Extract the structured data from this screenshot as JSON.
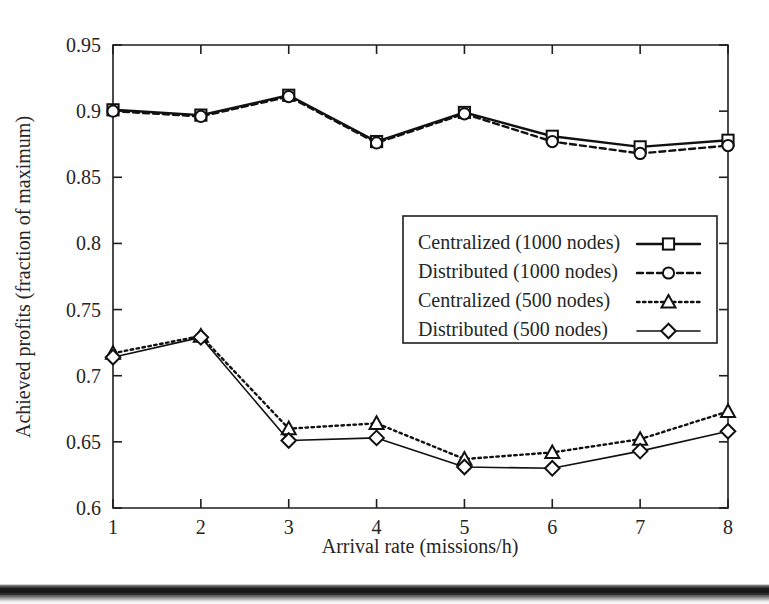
{
  "chart_data": {
    "type": "line",
    "title": "",
    "xlabel": "Arrival rate (missions/h)",
    "ylabel": "Achieved profits (fraction of maximum)",
    "x": [
      1,
      2,
      3,
      4,
      5,
      6,
      7,
      8
    ],
    "xlim": [
      1,
      8
    ],
    "ylim": [
      0.6,
      0.95
    ],
    "xticks": [
      "1",
      "2",
      "3",
      "4",
      "5",
      "6",
      "7",
      "8"
    ],
    "yticks": [
      "0.6",
      "0.65",
      "0.7",
      "0.75",
      "0.8",
      "0.85",
      "0.9",
      "0.95"
    ],
    "grid": false,
    "legend_position": "center-right",
    "series": [
      {
        "name": "Centralized (1000 nodes)",
        "marker": "square",
        "linestyle": "solid",
        "values": [
          0.901,
          0.897,
          0.912,
          0.877,
          0.899,
          0.881,
          0.873,
          0.878
        ]
      },
      {
        "name": "Distributed (1000 nodes)",
        "marker": "circle",
        "linestyle": "dashed",
        "values": [
          0.9,
          0.896,
          0.911,
          0.876,
          0.898,
          0.877,
          0.868,
          0.874
        ]
      },
      {
        "name": "Centralized (500 nodes)",
        "marker": "triangle",
        "linestyle": "dotted",
        "values": [
          0.717,
          0.73,
          0.66,
          0.664,
          0.637,
          0.642,
          0.652,
          0.673
        ]
      },
      {
        "name": "Distributed (500 nodes)",
        "marker": "diamond",
        "linestyle": "thin-solid",
        "values": [
          0.714,
          0.729,
          0.651,
          0.653,
          0.631,
          0.63,
          0.643,
          0.658
        ]
      }
    ]
  },
  "legend": {
    "entries": [
      {
        "label": "Centralized (1000 nodes)"
      },
      {
        "label": "Distributed (1000 nodes)"
      },
      {
        "label": "Centralized (500 nodes)"
      },
      {
        "label": "Distributed (500 nodes)"
      }
    ]
  },
  "axes": {
    "x_title": "Arrival rate (missions/h)",
    "y_title": "Achieved profits (fraction of maximum)",
    "x_tick_labels": [
      "1",
      "2",
      "3",
      "4",
      "5",
      "6",
      "7",
      "8"
    ],
    "y_tick_labels": [
      "0.6",
      "0.65",
      "0.7",
      "0.75",
      "0.8",
      "0.85",
      "0.9",
      "0.95"
    ]
  },
  "colors": {
    "ink": "#111111",
    "background": "#ffffff"
  }
}
